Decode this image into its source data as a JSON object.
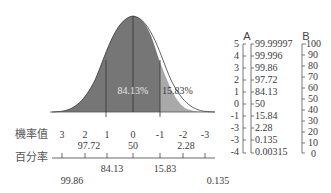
{
  "curve": {
    "area_left_label": "84.13%",
    "area_right_label": "15.83%",
    "colors": {
      "left_fill": "#767676",
      "right_fill": "#a6a6a6",
      "line": "#333333"
    }
  },
  "bottom_axis": {
    "row1_label": "機率值",
    "row2_label": "百分率",
    "z_values": [
      "3",
      "2",
      "1",
      "0",
      "-1",
      "-2",
      "-3"
    ],
    "upper_percentiles": [
      "97.72",
      "50",
      "2.28"
    ],
    "lower_percentiles_mid": [
      "84.13",
      "15.83"
    ],
    "lower_percentiles_outer": [
      "99.86",
      "0.135"
    ]
  },
  "scale_a": {
    "header": "A",
    "z_ticks": [
      "5",
      "4",
      "3",
      "2",
      "1",
      "0",
      "-1",
      "-3",
      "-3",
      "-4"
    ],
    "percent_ticks": [
      "99.99997",
      "99.996",
      "99.86",
      "97.72",
      "84.13",
      "50",
      "15.84",
      "2.28",
      "0.135",
      "0.00315"
    ]
  },
  "scale_b": {
    "header": "B",
    "ticks": [
      "100",
      "90",
      "80",
      "70",
      "60",
      "50",
      "40",
      "30",
      "20",
      "10",
      "0"
    ]
  }
}
